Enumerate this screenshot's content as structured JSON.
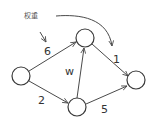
{
  "diagram": {
    "type": "weighted-directed-graph",
    "annotation": {
      "text": "权重",
      "x": 24,
      "y": 18
    },
    "nodes": [
      {
        "id": "left",
        "cx": 21,
        "cy": 76,
        "r": 9
      },
      {
        "id": "top",
        "cx": 85,
        "cy": 38,
        "r": 9
      },
      {
        "id": "bottom",
        "cx": 77,
        "cy": 107,
        "r": 9
      },
      {
        "id": "right",
        "cx": 136,
        "cy": 80,
        "r": 9
      }
    ],
    "edges": [
      {
        "from": "left",
        "to": "top",
        "weight": "6",
        "lx": 45,
        "ly": 54
      },
      {
        "from": "left",
        "to": "bottom",
        "weight": "2",
        "lx": 38,
        "ly": 103
      },
      {
        "from": "bottom",
        "to": "top",
        "weight": "w",
        "lx": 66,
        "ly": 75
      },
      {
        "from": "top",
        "to": "right",
        "weight": "1",
        "lx": 114,
        "ly": 62
      },
      {
        "from": "bottom",
        "to": "right",
        "weight": "5",
        "lx": 102,
        "ly": 112
      }
    ]
  }
}
